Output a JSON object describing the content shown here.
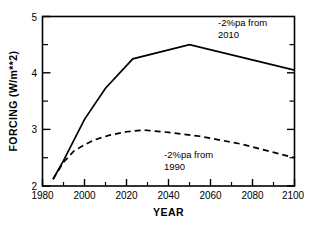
{
  "chart_data": {
    "type": "line",
    "title": "",
    "xlabel": "YEAR",
    "ylabel": "FORCING  (W/m**2)",
    "xlim": [
      1980,
      2100
    ],
    "ylim": [
      2,
      5
    ],
    "grid": false,
    "legend": "annotations-inline",
    "x_ticks": [
      1980,
      2000,
      2020,
      2040,
      2060,
      2080,
      2100
    ],
    "x_tick_labels": [
      "1980",
      "2000",
      "2020",
      "2040",
      "2060",
      "2080",
      "2100"
    ],
    "x_minor_ticks": [
      1990,
      2010,
      2030,
      2050,
      2070,
      2090
    ],
    "y_ticks": [
      2,
      3,
      4,
      5
    ],
    "y_tick_labels": [
      "2",
      "3",
      "4",
      "5"
    ],
    "y_minor_ticks": [
      2.5,
      3.5,
      4.5
    ],
    "series": [
      {
        "name": "-2%pa from 2010",
        "style": "solid",
        "color": "#000000",
        "x": [
          1985,
          1990,
          2000,
          2010,
          2023,
          2050,
          2100
        ],
        "values": [
          2.12,
          2.45,
          3.18,
          3.73,
          4.25,
          4.5,
          4.05
        ]
      },
      {
        "name": "-2%pa from 1990",
        "style": "dashed",
        "color": "#000000",
        "x": [
          1985,
          1990,
          1995,
          2000,
          2005,
          2012,
          2020,
          2028,
          2040,
          2055,
          2075,
          2100
        ],
        "values": [
          2.12,
          2.42,
          2.62,
          2.73,
          2.82,
          2.9,
          2.96,
          2.99,
          2.95,
          2.88,
          2.74,
          2.5
        ]
      }
    ],
    "annotations": [
      {
        "id": "upper",
        "line1": "-2%pa from",
        "line2": "2010",
        "x_px": 218,
        "y_px": 26
      },
      {
        "id": "lower",
        "line1": "-2%pa from",
        "line2": "1990",
        "x_px": 164,
        "y_px": 158
      }
    ]
  }
}
